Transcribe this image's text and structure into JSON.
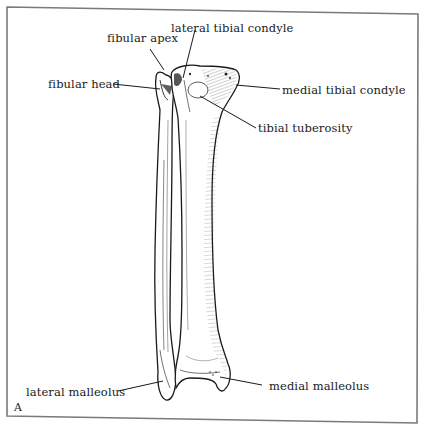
{
  "figure": {
    "panel_letter": "A",
    "labels": {
      "lateral_tibial_condyle": "lateral tibial condyle",
      "fibular_apex": "fibular apex",
      "fibular_head": "fibular head",
      "medial_tibial_condyle": "medial tibial condyle",
      "tibial_tuberosity": "tibial tuberosity",
      "lateral_malleolus": "lateral malleolus",
      "medial_malleolus": "medial malleolus"
    },
    "colors": {
      "ink": "#1a1a1a",
      "frame": "#7a7a7a",
      "background": "#ffffff"
    }
  }
}
